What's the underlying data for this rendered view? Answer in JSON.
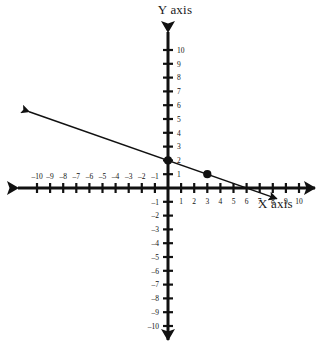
{
  "figure": {
    "background_color": "#ffffff",
    "ink_color": "#111111",
    "x_axis_title": "X axis",
    "y_axis_title": "Y axis"
  },
  "chart_data": {
    "type": "line",
    "title": "",
    "xlabel": "X axis",
    "ylabel": "Y axis",
    "xlim": [
      -10,
      10
    ],
    "ylim": [
      -10,
      10
    ],
    "grid": false,
    "legend": "none",
    "x_ticks": [
      -10,
      -9,
      -8,
      -7,
      -6,
      -5,
      -4,
      -3,
      -2,
      -1,
      1,
      2,
      3,
      4,
      5,
      6,
      7,
      8,
      9,
      10
    ],
    "y_ticks": [
      -10,
      -9,
      -8,
      -7,
      -6,
      -5,
      -4,
      -3,
      -2,
      -1,
      1,
      2,
      3,
      4,
      5,
      6,
      7,
      8,
      9,
      10
    ],
    "x_tick_labels_negative": [
      "–10",
      "–9",
      "–8",
      "–7",
      "–6",
      "–5",
      "–4",
      "–3",
      "–2",
      "–1"
    ],
    "x_tick_labels_positive": [
      "1",
      "2",
      "3",
      "4",
      "5",
      "6",
      "7",
      "8",
      "9",
      "10"
    ],
    "y_tick_labels_positive": [
      "1",
      "2",
      "3",
      "4",
      "5",
      "6",
      "7",
      "8",
      "9",
      "10"
    ],
    "y_tick_labels_negative": [
      "–1",
      "–2",
      "–3",
      "–4",
      "–5",
      "–6",
      "–7",
      "–8",
      "–9",
      "–10"
    ],
    "series": [
      {
        "name": "line",
        "equation": "y = -x/3 + 2",
        "slope": -0.3333,
        "intercept": 2,
        "x": [
          -10.6,
          8.3
        ],
        "y": [
          5.53,
          -0.77
        ],
        "arrow_start": true,
        "arrow_end": true,
        "color": "#111111"
      }
    ],
    "points": [
      {
        "label": "",
        "x": 0,
        "y": 2
      },
      {
        "label": "",
        "x": 3,
        "y": 1
      }
    ]
  }
}
